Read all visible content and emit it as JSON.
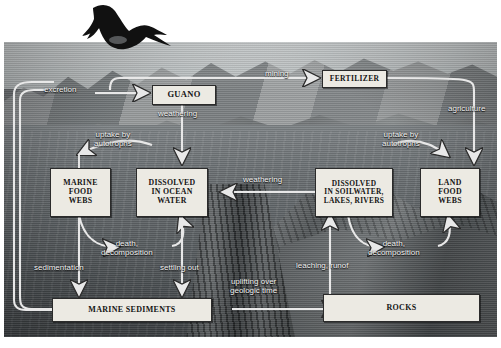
{
  "diagram": {
    "type": "nutrient-cycle-diagram",
    "accent_box_fill": "#eceae3",
    "accent_box_stroke": "#2b2b2b",
    "label_color": "#f2f2f2",
    "arrow_color": "#e8e8e8"
  },
  "bird": {
    "name": "frigatebird-silhouette",
    "color": "#111111"
  },
  "boxes": [
    {
      "id": "guano",
      "label": "GUANO"
    },
    {
      "id": "fertilizer",
      "label": "FERTILIZER"
    },
    {
      "id": "marine_food_webs",
      "label": "MARINE\nFOOD\nWEBS"
    },
    {
      "id": "dissolved_ocean",
      "label": "DISSOLVED\nIN OCEAN\nWATER"
    },
    {
      "id": "dissolved_soil",
      "label": "DISSOLVED\nIN SOILWATER,\nLAKES, RIVERS"
    },
    {
      "id": "land_food_webs",
      "label": "LAND\nFOOD\nWEBS"
    },
    {
      "id": "marine_sediments",
      "label": "MARINE SEDIMENTS"
    },
    {
      "id": "rocks",
      "label": "ROCKS"
    }
  ],
  "flow_labels": [
    {
      "id": "excretion",
      "text": "excretion"
    },
    {
      "id": "mining",
      "text": "mining"
    },
    {
      "id": "agriculture",
      "text": "agriculture"
    },
    {
      "id": "weathering_guano",
      "text": "weathering"
    },
    {
      "id": "uptake_marine",
      "text": "uptake by\nautotrophs"
    },
    {
      "id": "uptake_land",
      "text": "uptake by\nautotrophs"
    },
    {
      "id": "weathering_mid",
      "text": "weathering"
    },
    {
      "id": "death_decomp_marine",
      "text": "death,\ndecomposition"
    },
    {
      "id": "death_decomp_land",
      "text": "death,\ndecomposition"
    },
    {
      "id": "sedimentation",
      "text": "sedimentation"
    },
    {
      "id": "settling_out",
      "text": "settling out"
    },
    {
      "id": "leaching_runoff",
      "text": "leaching, runof"
    },
    {
      "id": "uplifting",
      "text": "uplifting over\ngeologic time"
    }
  ]
}
